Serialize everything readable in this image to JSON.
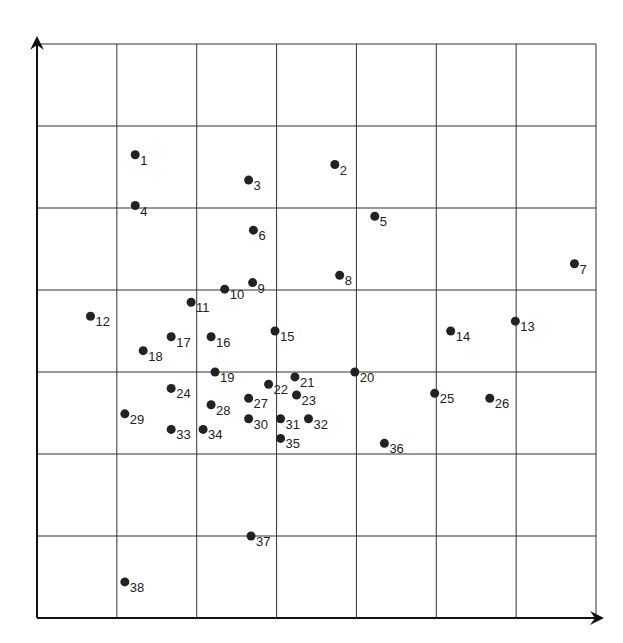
{
  "chart_data": {
    "type": "scatter",
    "title": "",
    "xlabel": "",
    "ylabel": "",
    "grid": true,
    "xlim": [
      0,
      7
    ],
    "ylim": [
      0,
      7
    ],
    "grid_divisions": 7,
    "marker_color": "#222222",
    "points": [
      {
        "label": "1",
        "x": 1.23,
        "y": 5.65
      },
      {
        "label": "2",
        "x": 3.73,
        "y": 5.53
      },
      {
        "label": "3",
        "x": 2.65,
        "y": 5.34
      },
      {
        "label": "4",
        "x": 1.23,
        "y": 5.03
      },
      {
        "label": "5",
        "x": 4.23,
        "y": 4.9
      },
      {
        "label": "6",
        "x": 2.71,
        "y": 4.73
      },
      {
        "label": "7",
        "x": 6.73,
        "y": 4.32
      },
      {
        "label": "8",
        "x": 3.79,
        "y": 4.18
      },
      {
        "label": "9",
        "x": 2.7,
        "y": 4.09
      },
      {
        "label": "10",
        "x": 2.35,
        "y": 4.01
      },
      {
        "label": "11",
        "x": 1.93,
        "y": 3.85
      },
      {
        "label": "12",
        "x": 0.67,
        "y": 3.68
      },
      {
        "label": "13",
        "x": 5.99,
        "y": 3.62
      },
      {
        "label": "14",
        "x": 5.18,
        "y": 3.5
      },
      {
        "label": "15",
        "x": 2.98,
        "y": 3.5
      },
      {
        "label": "16",
        "x": 2.18,
        "y": 3.43
      },
      {
        "label": "17",
        "x": 1.68,
        "y": 3.43
      },
      {
        "label": "18",
        "x": 1.33,
        "y": 3.26
      },
      {
        "label": "19",
        "x": 2.23,
        "y": 3.0
      },
      {
        "label": "20",
        "x": 3.98,
        "y": 3.0
      },
      {
        "label": "21",
        "x": 3.23,
        "y": 2.94
      },
      {
        "label": "22",
        "x": 2.9,
        "y": 2.85
      },
      {
        "label": "23",
        "x": 3.25,
        "y": 2.72
      },
      {
        "label": "24",
        "x": 1.68,
        "y": 2.8
      },
      {
        "label": "25",
        "x": 4.98,
        "y": 2.74
      },
      {
        "label": "26",
        "x": 5.67,
        "y": 2.68
      },
      {
        "label": "27",
        "x": 2.65,
        "y": 2.68
      },
      {
        "label": "28",
        "x": 2.18,
        "y": 2.6
      },
      {
        "label": "29",
        "x": 1.1,
        "y": 2.49
      },
      {
        "label": "30",
        "x": 2.65,
        "y": 2.43
      },
      {
        "label": "31",
        "x": 3.05,
        "y": 2.43
      },
      {
        "label": "32",
        "x": 3.4,
        "y": 2.43
      },
      {
        "label": "33",
        "x": 1.68,
        "y": 2.3
      },
      {
        "label": "34",
        "x": 2.08,
        "y": 2.3
      },
      {
        "label": "35",
        "x": 3.05,
        "y": 2.19
      },
      {
        "label": "36",
        "x": 4.35,
        "y": 2.13
      },
      {
        "label": "37",
        "x": 2.68,
        "y": 1.0
      },
      {
        "label": "38",
        "x": 1.1,
        "y": 0.44
      }
    ]
  }
}
